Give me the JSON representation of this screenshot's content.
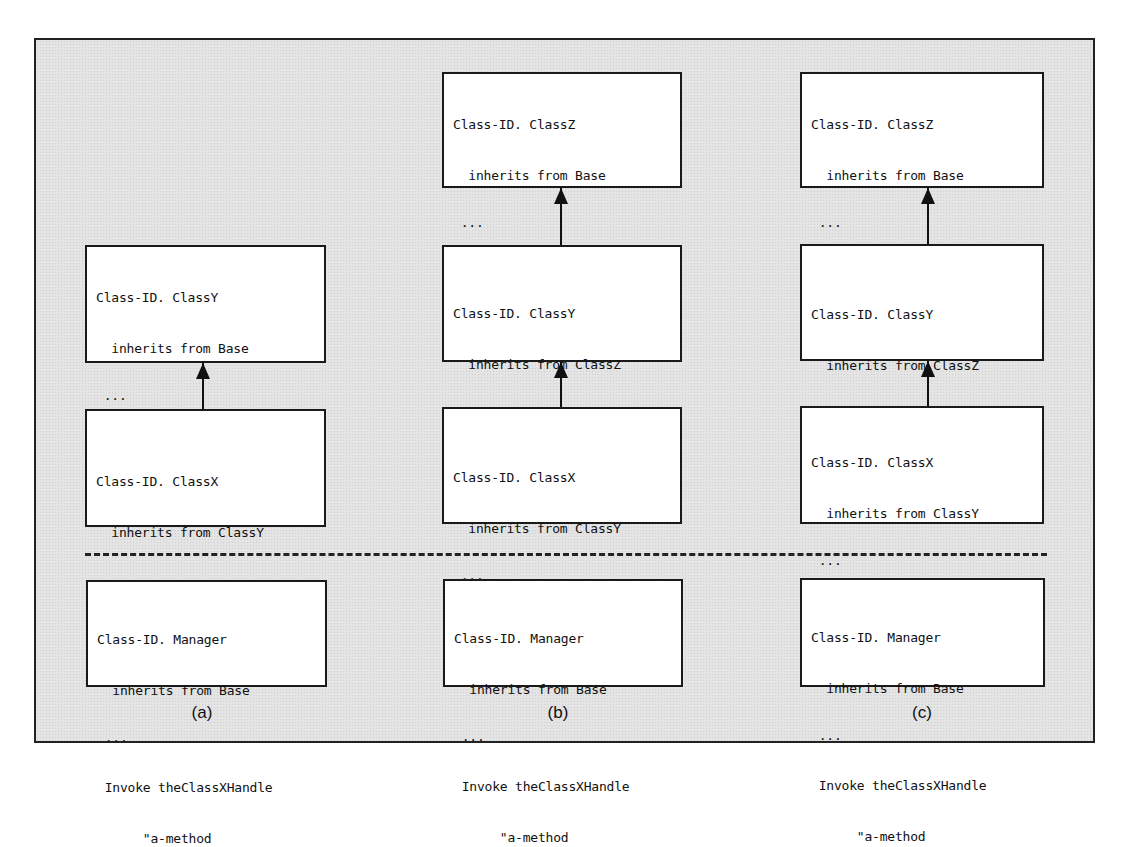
{
  "figure": {
    "columns": [
      {
        "label": "(a)",
        "boxes": [
          {
            "id": "a-classY",
            "lines": [
              "Class-ID. ClassY",
              "  inherits from Base",
              " ...",
              " Method-ID. \"a-method\".",
              "  ..."
            ]
          },
          {
            "id": "a-classX",
            "lines": [
              "Class-ID. ClassX",
              "  inherits from ClassY",
              " ..."
            ]
          }
        ],
        "manager": {
          "lines": [
            "Class-ID. Manager",
            "  inherits from Base",
            " ...",
            " Invoke theClassXHandle",
            "      \"a-method"
          ]
        }
      },
      {
        "label": "(b)",
        "boxes": [
          {
            "id": "b-classZ",
            "lines": [
              "Class-ID. ClassZ",
              "  inherits from Base",
              " ...",
              " Method-ID. \"a-method\".",
              "  ..."
            ]
          },
          {
            "id": "b-classY",
            "lines": [
              "Class-ID. ClassY",
              "  inherits from ClassZ",
              " ..."
            ]
          },
          {
            "id": "b-classX",
            "lines": [
              "Class-ID. ClassX",
              "  inherits from ClassY",
              " ..."
            ]
          }
        ],
        "manager": {
          "lines": [
            "Class-ID. Manager",
            "  inherits from Base",
            " ...",
            " Invoke theClassXHandle",
            "      \"a-method"
          ]
        }
      },
      {
        "label": "(c)",
        "boxes": [
          {
            "id": "c-classZ",
            "lines": [
              "Class-ID. ClassZ",
              "  inherits from Base",
              " ...",
              " Method-ID. \"a-method\".",
              "  ..."
            ]
          },
          {
            "id": "c-classY",
            "lines": [
              "Class-ID. ClassY",
              "  inherits from ClassZ",
              " ..."
            ]
          },
          {
            "id": "c-classX",
            "lines": [
              "Class-ID. ClassX",
              "  inherits from ClassY",
              " ...",
              " Method-ID. \"a-method\".",
              "  ..."
            ]
          }
        ],
        "manager": {
          "lines": [
            "Class-ID. Manager",
            "  inherits from Base",
            " ...",
            " Invoke theClassXHandle",
            "      \"a-method"
          ]
        }
      }
    ],
    "colors": {
      "background": "#e4e4e4",
      "box_fill": "#ffffff",
      "stroke": "#1a1a1a"
    }
  }
}
